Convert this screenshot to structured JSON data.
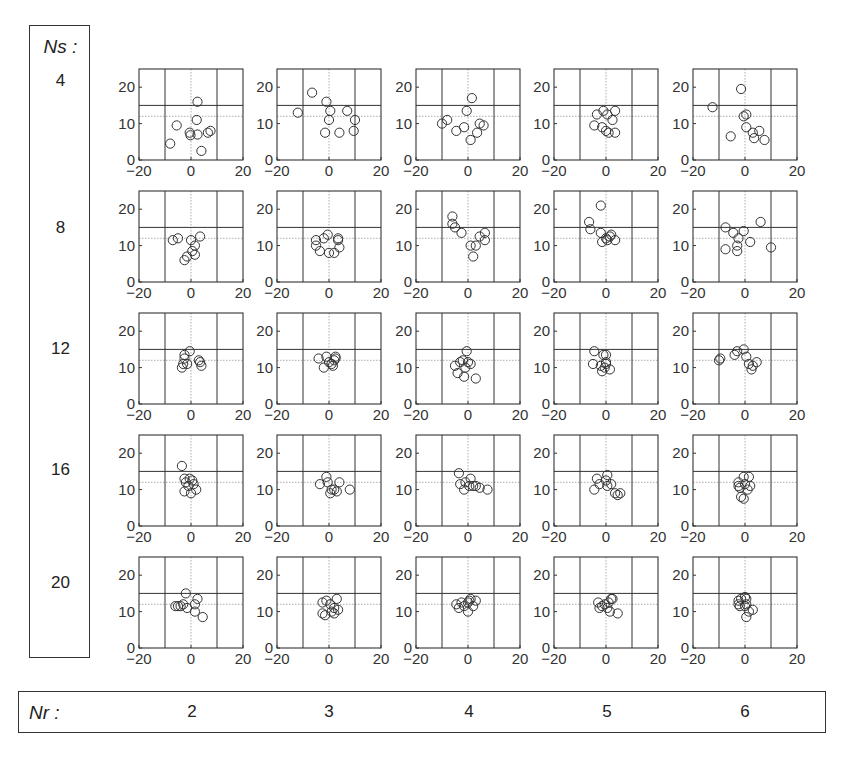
{
  "chart_data": {
    "type": "scatter",
    "layout": "grid",
    "row_label_title": "Ns :",
    "col_label_title": "Nr :",
    "row_values": [
      "4",
      "8",
      "12",
      "16",
      "20"
    ],
    "col_values": [
      "2",
      "3",
      "4",
      "5",
      "6"
    ],
    "xlim": [
      -20,
      20
    ],
    "ylim": [
      0,
      25
    ],
    "xticks": [
      "-20",
      "0",
      "20"
    ],
    "yticks": [
      "0",
      "10",
      "20"
    ],
    "reference_lines": {
      "vertical_solid": [
        -10,
        10
      ],
      "horizontal_solid": [
        15
      ],
      "vertical_dotted": [
        0
      ],
      "horizontal_dotted": [
        12
      ]
    },
    "marker": "open-circle",
    "panels": [
      [
        {
          "points": [
            [
              -8,
              4.5
            ],
            [
              -5.5,
              9.5
            ],
            [
              -0.5,
              7.5
            ],
            [
              -0.2,
              6.8
            ],
            [
              2.5,
              7
            ],
            [
              2.2,
              11
            ],
            [
              2.5,
              16
            ],
            [
              4,
              2.5
            ],
            [
              6.5,
              7.5
            ],
            [
              7.5,
              8
            ]
          ]
        },
        {
          "points": [
            [
              -12,
              13
            ],
            [
              -6.5,
              18.5
            ],
            [
              -1,
              16
            ],
            [
              0.5,
              13.5
            ],
            [
              0,
              11
            ],
            [
              -1.5,
              7.5
            ],
            [
              4,
              7.5
            ],
            [
              7,
              13.5
            ],
            [
              9.5,
              8
            ],
            [
              10,
              11
            ]
          ]
        },
        {
          "points": [
            [
              -10,
              10
            ],
            [
              -8,
              11
            ],
            [
              -4.5,
              8
            ],
            [
              -1.5,
              9
            ],
            [
              -0.5,
              13.5
            ],
            [
              1.5,
              17
            ],
            [
              1,
              5.5
            ],
            [
              3.5,
              7.5
            ],
            [
              4.5,
              10
            ],
            [
              6,
              9.5
            ]
          ]
        },
        {
          "points": [
            [
              -4.5,
              9.5
            ],
            [
              -3.5,
              12.5
            ],
            [
              -1,
              13.5
            ],
            [
              -1.5,
              9
            ],
            [
              0.5,
              12.5
            ],
            [
              0,
              8
            ],
            [
              2.5,
              11
            ],
            [
              3.5,
              13.5
            ],
            [
              3.5,
              7.5
            ],
            [
              1,
              7.5
            ]
          ]
        },
        {
          "points": [
            [
              -12.5,
              14.5
            ],
            [
              -5.5,
              6.5
            ],
            [
              -1.5,
              19.5
            ],
            [
              -0.5,
              12
            ],
            [
              0.5,
              12.5
            ],
            [
              0.5,
              9
            ],
            [
              3,
              7.5
            ],
            [
              3.5,
              6
            ],
            [
              5.5,
              8
            ],
            [
              7.5,
              5.5
            ]
          ]
        }
      ],
      [
        {
          "points": [
            [
              -7,
              11.5
            ],
            [
              -5,
              12
            ],
            [
              0,
              11.5
            ],
            [
              3.5,
              12.5
            ],
            [
              1.5,
              10
            ],
            [
              0.5,
              8.5
            ],
            [
              1.5,
              7.5
            ],
            [
              -1.5,
              7
            ],
            [
              -2.5,
              6
            ]
          ]
        },
        {
          "points": [
            [
              -5,
              11.5
            ],
            [
              -5,
              10
            ],
            [
              -2,
              12
            ],
            [
              -3.5,
              8.5
            ],
            [
              -0.5,
              13
            ],
            [
              0,
              8
            ],
            [
              2,
              8
            ],
            [
              3.5,
              12
            ],
            [
              3.5,
              11.5
            ],
            [
              4,
              9.5
            ]
          ]
        },
        {
          "points": [
            [
              -6,
              18
            ],
            [
              -6,
              16
            ],
            [
              -5,
              15
            ],
            [
              -2.5,
              13.5
            ],
            [
              1,
              10
            ],
            [
              2,
              7
            ],
            [
              3,
              10
            ],
            [
              4.5,
              12.5
            ],
            [
              6.5,
              13.5
            ],
            [
              6.5,
              11.5
            ]
          ]
        },
        {
          "points": [
            [
              -6.5,
              16.5
            ],
            [
              -6,
              14.5
            ],
            [
              -2,
              21
            ],
            [
              -2,
              13.5
            ],
            [
              -1.5,
              11
            ],
            [
              0,
              12
            ],
            [
              0.5,
              11.5
            ],
            [
              1.5,
              12.5
            ],
            [
              2,
              13
            ],
            [
              3.5,
              11.5
            ]
          ]
        },
        {
          "points": [
            [
              -7.5,
              15
            ],
            [
              -4.5,
              13.5
            ],
            [
              -2.5,
              12
            ],
            [
              -3,
              10
            ],
            [
              -3,
              8.5
            ],
            [
              -0.5,
              14
            ],
            [
              2,
              11
            ],
            [
              6,
              16.5
            ],
            [
              10,
              9.5
            ],
            [
              -7.5,
              9
            ]
          ]
        }
      ],
      [
        {
          "points": [
            [
              -3.5,
              10
            ],
            [
              -3,
              11
            ],
            [
              -2.5,
              13.5
            ],
            [
              -2.5,
              12.5
            ],
            [
              -1.5,
              11
            ],
            [
              -0.5,
              14.5
            ],
            [
              3,
              12
            ],
            [
              3.5,
              11.5
            ],
            [
              4,
              10.5
            ]
          ]
        },
        {
          "points": [
            [
              -4,
              12.5
            ],
            [
              -2,
              10
            ],
            [
              -1,
              13
            ],
            [
              0,
              11.5
            ],
            [
              1,
              11
            ],
            [
              1.5,
              10.5
            ],
            [
              2.5,
              12.5
            ],
            [
              2,
              12
            ],
            [
              2.5,
              13
            ]
          ]
        },
        {
          "points": [
            [
              -5,
              10.5
            ],
            [
              -3,
              11.5
            ],
            [
              -4,
              8.5
            ],
            [
              -2,
              12
            ],
            [
              -1,
              10
            ],
            [
              -0.5,
              14.5
            ],
            [
              0,
              11.5
            ],
            [
              1,
              11
            ],
            [
              -1.5,
              7.5
            ],
            [
              3,
              7
            ]
          ]
        },
        {
          "points": [
            [
              -4.5,
              14.5
            ],
            [
              -5,
              11
            ],
            [
              -2,
              10.5
            ],
            [
              -1.5,
              9
            ],
            [
              -1,
              13.5
            ],
            [
              0,
              11.5
            ],
            [
              -0.5,
              10
            ],
            [
              0,
              13.5
            ],
            [
              1.5,
              9.5
            ],
            [
              0,
              11
            ]
          ]
        },
        {
          "points": [
            [
              -10,
              12
            ],
            [
              -9.5,
              12.5
            ],
            [
              -4,
              13.5
            ],
            [
              -3,
              14.5
            ],
            [
              -0.5,
              15
            ],
            [
              0.5,
              13
            ],
            [
              1.5,
              11
            ],
            [
              2.5,
              9.5
            ],
            [
              3,
              10.5
            ],
            [
              4.5,
              11.5
            ]
          ]
        }
      ],
      [
        {
          "points": [
            [
              -3.5,
              16.5
            ],
            [
              -2.5,
              13
            ],
            [
              -2,
              12
            ],
            [
              -0.5,
              13
            ],
            [
              -1,
              11
            ],
            [
              0.5,
              12.5
            ],
            [
              1,
              11.5
            ],
            [
              2,
              10
            ],
            [
              0,
              9
            ],
            [
              -2.5,
              9.5
            ]
          ]
        },
        {
          "points": [
            [
              -3.5,
              11.5
            ],
            [
              -1,
              13.5
            ],
            [
              -0.5,
              12
            ],
            [
              1,
              10
            ],
            [
              0.5,
              9
            ],
            [
              2,
              10
            ],
            [
              3,
              9.5
            ],
            [
              4,
              12
            ],
            [
              8,
              10
            ]
          ]
        },
        {
          "points": [
            [
              -3.5,
              14.5
            ],
            [
              -3,
              11.5
            ],
            [
              -1.5,
              10
            ],
            [
              -1,
              12
            ],
            [
              1,
              13
            ],
            [
              0.5,
              11
            ],
            [
              2,
              11
            ],
            [
              3,
              11
            ],
            [
              4.5,
              10.5
            ],
            [
              7.5,
              10
            ]
          ]
        },
        {
          "points": [
            [
              -4.5,
              10
            ],
            [
              -3.5,
              13
            ],
            [
              -2.5,
              11.5
            ],
            [
              0,
              12.5
            ],
            [
              0.5,
              14
            ],
            [
              0.5,
              11
            ],
            [
              2,
              11.5
            ],
            [
              3.5,
              9
            ],
            [
              4.5,
              8.5
            ],
            [
              5.5,
              9
            ]
          ]
        },
        {
          "points": [
            [
              -2.5,
              11
            ],
            [
              -2,
              10.5
            ],
            [
              -1.5,
              8
            ],
            [
              -0.5,
              13.5
            ],
            [
              0,
              11.5
            ],
            [
              1,
              10
            ],
            [
              1.5,
              13.5
            ],
            [
              2,
              11
            ],
            [
              -0.5,
              7.5
            ],
            [
              -2.5,
              12
            ]
          ]
        }
      ],
      [
        {
          "points": [
            [
              -6,
              11.5
            ],
            [
              -5,
              11.5
            ],
            [
              -4,
              11.5
            ],
            [
              -3,
              12
            ],
            [
              -2,
              15
            ],
            [
              -1.5,
              11
            ],
            [
              1.5,
              12
            ],
            [
              2.5,
              13.5
            ],
            [
              1.5,
              10
            ],
            [
              4.5,
              8.5
            ]
          ]
        },
        {
          "points": [
            [
              -2.5,
              12.5
            ],
            [
              -2.5,
              9.5
            ],
            [
              -1.5,
              9
            ],
            [
              -1,
              13
            ],
            [
              0.5,
              12
            ],
            [
              1,
              10
            ],
            [
              2,
              11
            ],
            [
              3.5,
              10.5
            ],
            [
              2,
              9.5
            ],
            [
              3,
              13.5
            ]
          ]
        },
        {
          "points": [
            [
              -4.5,
              12
            ],
            [
              -3.5,
              11
            ],
            [
              -2.5,
              12.5
            ],
            [
              -1.5,
              11.5
            ],
            [
              0,
              12.5
            ],
            [
              0.5,
              13
            ],
            [
              0,
              10
            ],
            [
              2,
              11.5
            ],
            [
              3,
              13
            ],
            [
              1,
              13.5
            ]
          ]
        },
        {
          "points": [
            [
              -3,
              12.5
            ],
            [
              -2.5,
              11
            ],
            [
              -1.5,
              11.5
            ],
            [
              -0.5,
              12
            ],
            [
              0.5,
              11
            ],
            [
              1,
              12.5
            ],
            [
              2,
              13.5
            ],
            [
              1.5,
              10
            ],
            [
              2.5,
              13.5
            ],
            [
              4.5,
              9.5
            ]
          ]
        },
        {
          "points": [
            [
              -2.5,
              13
            ],
            [
              -2.5,
              12
            ],
            [
              -2,
              11.5
            ],
            [
              -1.5,
              13.5
            ],
            [
              0,
              14
            ],
            [
              0,
              11.5
            ],
            [
              0.5,
              12
            ],
            [
              1.5,
              10
            ],
            [
              3,
              10.5
            ],
            [
              0.5,
              8.5
            ],
            [
              0.5,
              13.5
            ]
          ]
        }
      ]
    ]
  }
}
